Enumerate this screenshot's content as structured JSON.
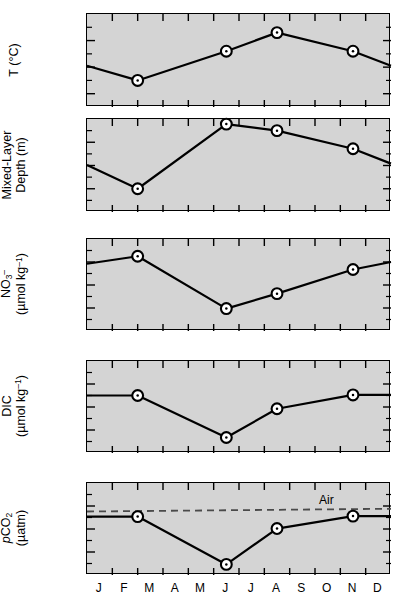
{
  "figure": {
    "background_color": "#ffffff",
    "panel_fill": "#d4d4d4",
    "line_color": "#000000",
    "marker_face": "#ffffff",
    "air_line_color": "#4a4a4a"
  },
  "x_axis": {
    "tick_labels": [
      "J",
      "F",
      "M",
      "A",
      "M",
      "J",
      "J",
      "A",
      "S",
      "O",
      "N",
      "D"
    ],
    "n_ticks": 13,
    "range": [
      0,
      12
    ],
    "label": ""
  },
  "chart_data": [
    {
      "type": "line",
      "title": "",
      "panel_id": "temperature",
      "xlabel": "",
      "ylabel": "T (°C)",
      "ylabel_html": "T (°C)",
      "ylim": [
        3,
        10
      ],
      "yticks": [
        4,
        6,
        8,
        10
      ],
      "ytick_labels": [
        "4",
        "6",
        "8",
        "10"
      ],
      "y_inverted": false,
      "grid": false,
      "legend": "none",
      "series": [
        {
          "name": "T",
          "x": [
            0,
            2,
            5.5,
            7.5,
            10.5,
            12
          ],
          "values": [
            6.1,
            5.0,
            7.2,
            8.6,
            7.2,
            6.1
          ],
          "markers_at_x": [
            2,
            5.5,
            7.5,
            10.5
          ],
          "marker_values": [
            5.0,
            7.2,
            8.6,
            7.2
          ]
        }
      ]
    },
    {
      "type": "line",
      "title": "",
      "panel_id": "mixed-layer-depth",
      "xlabel": "",
      "ylabel": "Mixed-Layer Depth (m)",
      "ylabel_line1": "Mixed-Layer",
      "ylabel_line2": "Depth (m)",
      "ylim": [
        0,
        400
      ],
      "yticks": [
        0,
        100,
        200,
        300,
        400
      ],
      "ytick_labels": [
        "0",
        "100",
        "200",
        "300",
        "400"
      ],
      "y_inverted": true,
      "grid": false,
      "legend": "none",
      "series": [
        {
          "name": "MLD",
          "x": [
            0,
            2,
            5.5,
            7.5,
            10.5,
            12
          ],
          "values": [
            198,
            300,
            22,
            50,
            128,
            192
          ],
          "markers_at_x": [
            2,
            5.5,
            7.5,
            10.5
          ],
          "marker_values": [
            300,
            22,
            50,
            128
          ]
        }
      ]
    },
    {
      "type": "line",
      "title": "",
      "panel_id": "nitrate",
      "xlabel": "",
      "ylabel": "NO3- (umol kg-1)",
      "ylabel_line1": "NO3-",
      "ylabel_line2": "(µmol kg-1)",
      "ylim": [
        2,
        18
      ],
      "yticks": [
        2,
        6,
        10,
        14,
        18
      ],
      "ytick_labels": [
        "2",
        "6",
        "10",
        "14",
        "18"
      ],
      "y_inverted": false,
      "grid": false,
      "legend": "none",
      "series": [
        {
          "name": "NO3",
          "x": [
            0,
            2,
            5.5,
            7.5,
            10.5,
            12
          ],
          "values": [
            13.7,
            15.0,
            5.9,
            8.5,
            12.7,
            14.0
          ],
          "markers_at_x": [
            2,
            5.5,
            7.5,
            10.5
          ],
          "marker_values": [
            15.0,
            5.9,
            8.5,
            12.7
          ]
        }
      ]
    },
    {
      "type": "line",
      "title": "",
      "panel_id": "dic",
      "xlabel": "",
      "ylabel": "DIC (umol kg-1)",
      "ylabel_line1": "DIC",
      "ylabel_line2": "(µmol kg-1)",
      "ylim": [
        2000,
        2160
      ],
      "yticks": [
        2000,
        2040,
        2080,
        2120,
        2160
      ],
      "ytick_labels": [
        "2000",
        "2040",
        "2080",
        "2120",
        "2160"
      ],
      "y_inverted": false,
      "grid": false,
      "legend": "none",
      "series": [
        {
          "name": "DIC",
          "x": [
            0,
            2,
            5.5,
            7.5,
            10.5,
            12
          ],
          "values": [
            2100,
            2100,
            2027,
            2077,
            2101,
            2101
          ],
          "markers_at_x": [
            2,
            5.5,
            7.5,
            10.5
          ],
          "marker_values": [
            2100,
            2027,
            2077,
            2101
          ]
        }
      ]
    },
    {
      "type": "line",
      "title": "",
      "panel_id": "pco2",
      "xlabel": "",
      "ylabel": "pCO2 (uatm)",
      "ylabel_line1": "pCO2",
      "ylabel_line2": "(µatm)",
      "ylim": [
        200,
        400
      ],
      "yticks": [
        200,
        250,
        300,
        350,
        400
      ],
      "ytick_labels": [
        "200",
        "250",
        "300",
        "350",
        "400"
      ],
      "y_inverted": false,
      "grid": false,
      "legend": "none",
      "annotations": [
        {
          "text": "Air",
          "x": 9.2,
          "y": 358,
          "name": "air-label"
        }
      ],
      "reference_line": {
        "name": "air-pco2-line",
        "label": "Air",
        "style": "dashed",
        "x_start": 0,
        "x_end": 12,
        "y_start": 338,
        "y_end": 344
      },
      "series": [
        {
          "name": "pCO2 seawater",
          "x": [
            0,
            2,
            5.5,
            7.5,
            10.5,
            12
          ],
          "values": [
            327,
            327,
            223,
            301,
            328,
            328
          ],
          "markers_at_x": [
            2,
            5.5,
            7.5,
            10.5
          ],
          "marker_values": [
            327,
            223,
            301,
            328
          ]
        }
      ]
    }
  ]
}
